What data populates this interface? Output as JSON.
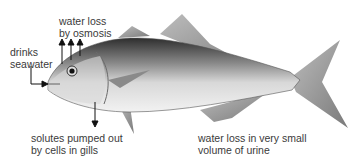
{
  "diagram": {
    "labels": {
      "water_loss_osmosis": "water loss\nby osmosis",
      "drinks_seawater": "drinks\nseawater",
      "solutes_pumped": "solutes pumped out\nby cells in gills",
      "urine": "water loss in very small\nvolume of urine"
    },
    "colors": {
      "text": "#3a3a3a",
      "arrow": "#111111",
      "fish_dark": "#3a3a3a",
      "fish_mid": "#9a9a9a",
      "fish_light": "#e6e6e6"
    }
  }
}
